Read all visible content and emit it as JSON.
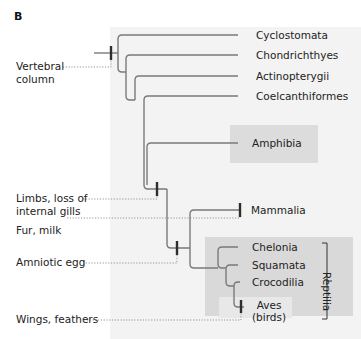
{
  "panel": {
    "label": "B"
  },
  "taxa": {
    "cyclostomata": "Cyclostomata",
    "chondrichthyes": "Chondrichthyes",
    "actinopterygii": "Actinopterygii",
    "coelcanthiformes": "Coelcanthiformes",
    "amphibia": "Amphibia",
    "mammalia": "Mammalia",
    "chelonia": "Chelonia",
    "squamata": "Squamata",
    "crocodilia": "Crocodilia",
    "aves_line1": "Aves",
    "aves_line2": "(birds)"
  },
  "clade_labels": {
    "reptilia": "Reptilia"
  },
  "traits": {
    "vertebral_line1": "Vertebral",
    "vertebral_line2": "column",
    "limbs_line1": "Limbs, loss of",
    "limbs_line2": "internal gills",
    "fur_milk": "Fur, milk",
    "amniotic_egg": "Amniotic egg",
    "wings_feathers": "Wings, feathers"
  },
  "colors": {
    "branch": "#777777",
    "tick": "#333333",
    "dotted": "#888888",
    "panel_bg": "#f3f3f3",
    "highlight_bg": "#d9d9d9"
  }
}
